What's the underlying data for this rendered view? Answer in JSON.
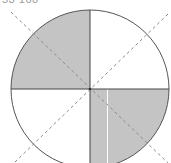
{
  "caption": "53 100",
  "diagram": {
    "type": "circle-quadrants",
    "center": [
      90,
      89
    ],
    "radius": 79,
    "shaded_quadrants": [
      "top-left",
      "bottom-right"
    ],
    "unshaded_quadrants": [
      "top-right",
      "bottom-left"
    ],
    "dashed_diagonals": 2,
    "colors": {
      "shade": "#c4c4c4",
      "stroke": "#555555",
      "dash": "#8a8a8a",
      "background": "#ffffff"
    }
  }
}
